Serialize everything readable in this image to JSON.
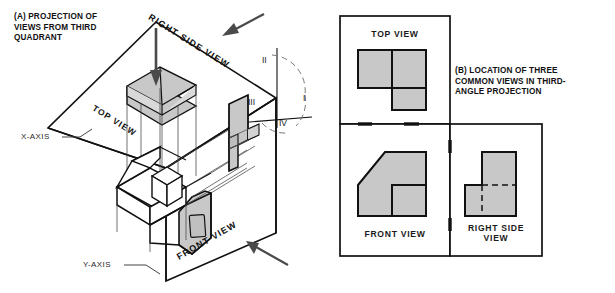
{
  "figure": {
    "panel_a": {
      "caption": "(A) PROJECTION OF\nVIEWS FROM THIRD\nQUADRANT",
      "plane_labels": {
        "right_side_view": "RIGHT SIDE VIEW",
        "top_view": "TOP VIEW",
        "front_view": "FRONT VIEW"
      },
      "axis_labels": {
        "x_axis": "X-AXIS",
        "y_axis": "Y-AXIS"
      },
      "quadrants": [
        {
          "id": "quadrant-1",
          "label": "I"
        },
        {
          "id": "quadrant-2",
          "label": "II"
        },
        {
          "id": "quadrant-3",
          "label": "III"
        },
        {
          "id": "quadrant-4",
          "label": "IV"
        }
      ],
      "direction_arrows": [
        {
          "id": "arrow-top-view",
          "points_to": "top-view-plane"
        },
        {
          "id": "arrow-right-side-view",
          "points_to": "right-side-view-plane"
        },
        {
          "id": "arrow-front-view",
          "points_to": "front-view-plane"
        }
      ]
    },
    "panel_b": {
      "caption": "(B)  LOCATION OF THREE\nCOMMON VIEWS IN THIRD-\nANGLE PROJECTION",
      "views": [
        {
          "id": "top-view",
          "label": "TOP VIEW"
        },
        {
          "id": "front-view",
          "label": "FRONT VIEW"
        },
        {
          "id": "right-side-view",
          "label": "RIGHT SIDE\nVIEW"
        }
      ]
    },
    "colors": {
      "ink": "#111111",
      "line": "#222222",
      "thin_line": "#555555",
      "shaded_face": "#c8c8c8",
      "shaded_face_light": "#d2d2d2",
      "background": "#ffffff",
      "arrow": "#4a4a4a"
    }
  }
}
